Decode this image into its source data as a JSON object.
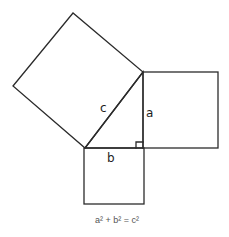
{
  "diagram": {
    "labels": {
      "hypotenuse": "c",
      "vertical_leg": "a",
      "horizontal_leg": "b"
    },
    "formula": "a² + b² = c²",
    "colors": {
      "line": "#2b2b2b",
      "background": "#ffffff",
      "formula_text": "#555555"
    },
    "shapes": {
      "right_triangle": [
        [
          85,
          148
        ],
        [
          143,
          72
        ],
        [
          143,
          148
        ]
      ],
      "square_on_c": [
        [
          85,
          148
        ],
        [
          143,
          72
        ],
        [
          73,
          13
        ],
        [
          13,
          86
        ]
      ],
      "square_on_a": [
        [
          143,
          72
        ],
        [
          218,
          72
        ],
        [
          218,
          148
        ],
        [
          143,
          148
        ]
      ],
      "square_on_b": [
        [
          84,
          148
        ],
        [
          144,
          148
        ],
        [
          144,
          204
        ],
        [
          84,
          204
        ]
      ],
      "right_angle_marker": [
        [
          136,
          142
        ],
        [
          143,
          148
        ]
      ]
    }
  }
}
